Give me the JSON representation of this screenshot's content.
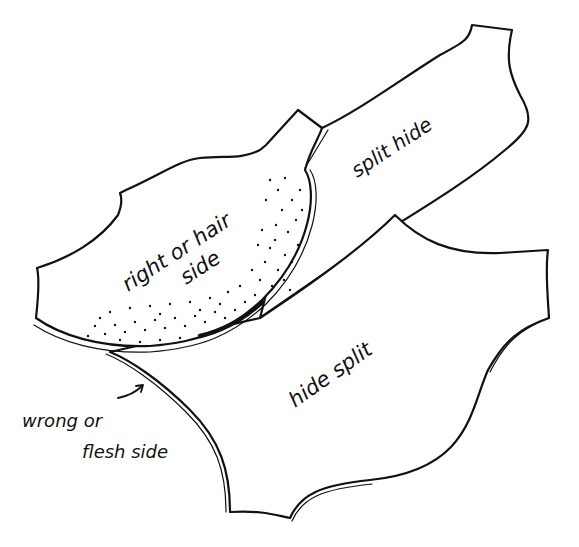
{
  "diagram": {
    "labels": {
      "right_side": {
        "line1": "right or hair",
        "line2": "side"
      },
      "split_hide": "split hide",
      "hide_split": "hide split",
      "wrong_side": {
        "line1": "wrong or",
        "line2": "flesh side"
      }
    },
    "parts": [
      {
        "id": "grain-layer",
        "name": "right or hair side",
        "fill": "stippled"
      },
      {
        "id": "split-hide",
        "name": "split hide",
        "fill": "plain"
      },
      {
        "id": "hide-split",
        "name": "hide split",
        "fill": "plain"
      }
    ],
    "colors": {
      "ink": "#111111",
      "paper": "#ffffff"
    }
  }
}
